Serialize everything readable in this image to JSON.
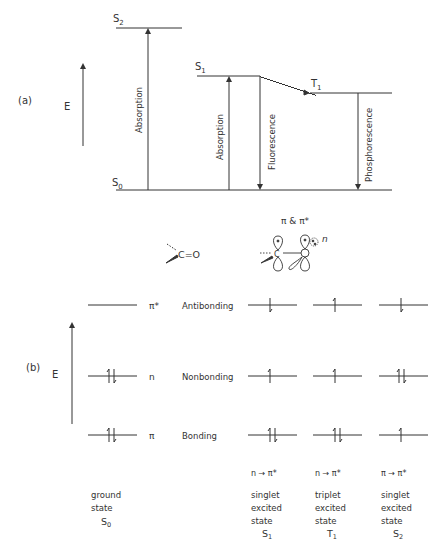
{
  "part_a": {
    "label": "(a)",
    "axis_label": "E",
    "levels": [
      {
        "id": "S2",
        "base": "S",
        "sub": "2"
      },
      {
        "id": "S1",
        "base": "S",
        "sub": "1"
      },
      {
        "id": "T1",
        "base": "T",
        "sub": "1"
      },
      {
        "id": "S0",
        "base": "S",
        "sub": "0"
      }
    ],
    "transitions": [
      {
        "label": "Absorption",
        "from": "S0",
        "to": "S2"
      },
      {
        "label": "Absorption",
        "from": "S0",
        "to": "S1"
      },
      {
        "label": "Fluorescence",
        "from": "S1",
        "to": "S0"
      },
      {
        "label": "Phosphorescence",
        "from": "T1",
        "to": "S0"
      }
    ],
    "isc": "S1 to T1 wavy"
  },
  "part_b": {
    "label": "(b)",
    "axis_label": "E",
    "molecule": "C=O",
    "orbital_title": "π & π*",
    "n_label": "n",
    "orbitals": [
      {
        "symbol": "π*",
        "name": "Antibonding"
      },
      {
        "symbol": "n",
        "name": "Nonbonding"
      },
      {
        "symbol": "π",
        "name": "Bonding"
      }
    ],
    "columns": [
      {
        "transition": "",
        "desc1": "ground",
        "desc2": "state",
        "desc3": "",
        "state_base": "S",
        "state_sub": "0"
      },
      {
        "transition": "n → π*",
        "desc1": "singlet",
        "desc2": "excited",
        "desc3": "state",
        "state_base": "S",
        "state_sub": "1"
      },
      {
        "transition": "n → π*",
        "desc1": "triplet",
        "desc2": "excited",
        "desc3": "state",
        "state_base": "T",
        "state_sub": "1"
      },
      {
        "transition": "π → π*",
        "desc1": "singlet",
        "desc2": "excited",
        "desc3": "state",
        "state_base": "S",
        "state_sub": "2"
      }
    ]
  }
}
